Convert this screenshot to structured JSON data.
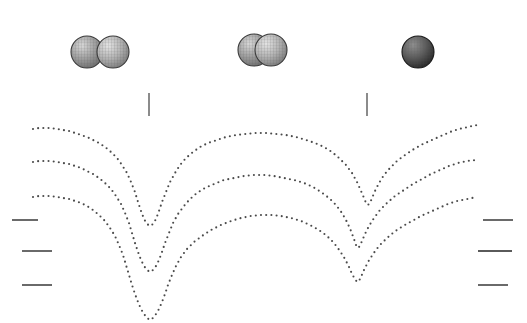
{
  "figure": {
    "title": "",
    "background_color": "#ffffff",
    "width": 527,
    "height": 323,
    "dot_color": "#4a4a4a",
    "tick_color": "#5a5a5a"
  },
  "sphere_groups": [
    {
      "name": "separated-pair",
      "label": "",
      "spheres": [
        {
          "cx": 87,
          "cy": 52,
          "r": 16,
          "fill": "#9a9a9a",
          "stroke": "#3a3a3a"
        },
        {
          "cx": 113,
          "cy": 52,
          "r": 16,
          "fill": "#b0b0b0",
          "stroke": "#3a3a3a"
        }
      ]
    },
    {
      "name": "overlapping-pair",
      "label": "",
      "spheres": [
        {
          "cx": 254,
          "cy": 50,
          "r": 16,
          "fill": "#909090",
          "stroke": "#3a3a3a"
        },
        {
          "cx": 271,
          "cy": 50,
          "r": 16,
          "fill": "#a8a8a8",
          "stroke": "#3a3a3a"
        }
      ]
    },
    {
      "name": "merged-single",
      "label": "",
      "spheres": [
        {
          "cx": 418,
          "cy": 52,
          "r": 16,
          "fill": "#5d5d5d",
          "stroke": "#1a1a1a"
        }
      ]
    }
  ],
  "vertical_ticks": [
    {
      "name": "vertical-tick-left",
      "x": 149,
      "y": 93,
      "height": 23
    },
    {
      "name": "vertical-tick-right",
      "x": 367,
      "y": 93,
      "height": 23
    }
  ],
  "axis_ticks_left": [
    {
      "name": "left-tick-1",
      "x": 12,
      "y": 220,
      "width": 26
    },
    {
      "name": "left-tick-2",
      "x": 22,
      "y": 251,
      "width": 30
    },
    {
      "name": "left-tick-3",
      "x": 22,
      "y": 285,
      "width": 30
    }
  ],
  "axis_ticks_right": [
    {
      "name": "right-tick-1",
      "x": 483,
      "y": 220,
      "width": 30
    },
    {
      "name": "right-tick-2",
      "x": 478,
      "y": 251,
      "width": 34
    },
    {
      "name": "right-tick-3",
      "x": 478,
      "y": 285,
      "width": 30
    }
  ],
  "chart_data": {
    "type": "line",
    "title": "",
    "subtitle": "",
    "xlabel": "",
    "ylabel": "",
    "xlim": [
      0,
      527
    ],
    "ylim": [
      323,
      0
    ],
    "grid": false,
    "legend": null,
    "line_style": "dotted",
    "annotations": [
      "separated spheres",
      "partially overlapping spheres",
      "fully merged sphere"
    ],
    "series": [
      {
        "name": "curve-top",
        "color": "#4a4a4a",
        "points": [
          [
            33,
            129
          ],
          [
            39,
            128
          ],
          [
            45,
            128
          ],
          [
            51,
            128
          ],
          [
            57,
            129
          ],
          [
            63,
            130
          ],
          [
            69,
            131
          ],
          [
            75,
            133
          ],
          [
            81,
            135
          ],
          [
            87,
            137
          ],
          [
            93,
            140
          ],
          [
            99,
            143
          ],
          [
            105,
            147
          ],
          [
            111,
            152
          ],
          [
            117,
            158
          ],
          [
            122,
            165
          ],
          [
            127,
            173
          ],
          [
            131,
            182
          ],
          [
            135,
            192
          ],
          [
            138,
            202
          ],
          [
            141,
            211
          ],
          [
            144,
            219
          ],
          [
            147,
            224
          ],
          [
            150,
            226
          ],
          [
            153,
            224
          ],
          [
            156,
            219
          ],
          [
            159,
            211
          ],
          [
            162,
            202
          ],
          [
            166,
            192
          ],
          [
            170,
            182
          ],
          [
            175,
            173
          ],
          [
            180,
            165
          ],
          [
            186,
            158
          ],
          [
            193,
            152
          ],
          [
            200,
            147
          ],
          [
            208,
            143
          ],
          [
            217,
            140
          ],
          [
            226,
            137
          ],
          [
            236,
            135
          ],
          [
            246,
            134
          ],
          [
            256,
            133
          ],
          [
            266,
            133
          ],
          [
            276,
            134
          ],
          [
            286,
            135
          ],
          [
            296,
            137
          ],
          [
            306,
            140
          ],
          [
            315,
            143
          ],
          [
            324,
            147
          ],
          [
            332,
            152
          ],
          [
            339,
            158
          ],
          [
            346,
            165
          ],
          [
            352,
            173
          ],
          [
            357,
            182
          ],
          [
            361,
            191
          ],
          [
            364,
            198
          ],
          [
            366,
            203
          ],
          [
            368,
            205
          ],
          [
            370,
            203
          ],
          [
            372,
            198
          ],
          [
            375,
            191
          ],
          [
            379,
            183
          ],
          [
            384,
            175
          ],
          [
            390,
            168
          ],
          [
            397,
            161
          ],
          [
            405,
            155
          ],
          [
            414,
            149
          ],
          [
            423,
            144
          ],
          [
            432,
            140
          ],
          [
            441,
            136
          ],
          [
            450,
            132
          ],
          [
            459,
            129
          ],
          [
            468,
            127
          ],
          [
            477,
            125
          ]
        ]
      },
      {
        "name": "curve-middle",
        "color": "#4a4a4a",
        "points": [
          [
            33,
            162
          ],
          [
            39,
            161
          ],
          [
            45,
            161
          ],
          [
            51,
            161
          ],
          [
            57,
            162
          ],
          [
            63,
            163
          ],
          [
            69,
            164
          ],
          [
            75,
            166
          ],
          [
            81,
            168
          ],
          [
            87,
            171
          ],
          [
            93,
            174
          ],
          [
            99,
            178
          ],
          [
            105,
            183
          ],
          [
            111,
            189
          ],
          [
            116,
            196
          ],
          [
            121,
            204
          ],
          [
            125,
            213
          ],
          [
            129,
            223
          ],
          [
            132,
            233
          ],
          [
            135,
            243
          ],
          [
            138,
            252
          ],
          [
            141,
            260
          ],
          [
            144,
            266
          ],
          [
            147,
            270
          ],
          [
            150,
            272
          ],
          [
            153,
            270
          ],
          [
            156,
            266
          ],
          [
            159,
            260
          ],
          [
            162,
            252
          ],
          [
            165,
            243
          ],
          [
            169,
            233
          ],
          [
            173,
            223
          ],
          [
            178,
            214
          ],
          [
            184,
            206
          ],
          [
            190,
            199
          ],
          [
            197,
            193
          ],
          [
            205,
            188
          ],
          [
            214,
            184
          ],
          [
            224,
            180
          ],
          [
            234,
            178
          ],
          [
            244,
            176
          ],
          [
            254,
            175
          ],
          [
            264,
            175
          ],
          [
            274,
            176
          ],
          [
            284,
            178
          ],
          [
            294,
            180
          ],
          [
            304,
            183
          ],
          [
            313,
            187
          ],
          [
            321,
            192
          ],
          [
            329,
            198
          ],
          [
            336,
            205
          ],
          [
            342,
            213
          ],
          [
            347,
            222
          ],
          [
            351,
            231
          ],
          [
            354,
            239
          ],
          [
            356,
            245
          ],
          [
            358,
            248
          ],
          [
            360,
            246
          ],
          [
            362,
            241
          ],
          [
            365,
            234
          ],
          [
            369,
            226
          ],
          [
            374,
            218
          ],
          [
            380,
            210
          ],
          [
            387,
            203
          ],
          [
            395,
            196
          ],
          [
            404,
            190
          ],
          [
            413,
            184
          ],
          [
            422,
            179
          ],
          [
            431,
            174
          ],
          [
            440,
            170
          ],
          [
            449,
            166
          ],
          [
            458,
            163
          ],
          [
            467,
            161
          ],
          [
            477,
            160
          ]
        ]
      },
      {
        "name": "curve-bottom",
        "color": "#4a4a4a",
        "points": [
          [
            33,
            197
          ],
          [
            39,
            196
          ],
          [
            45,
            196
          ],
          [
            51,
            196
          ],
          [
            57,
            197
          ],
          [
            63,
            198
          ],
          [
            69,
            199
          ],
          [
            75,
            201
          ],
          [
            81,
            203
          ],
          [
            87,
            206
          ],
          [
            93,
            210
          ],
          [
            99,
            215
          ],
          [
            105,
            221
          ],
          [
            110,
            228
          ],
          [
            115,
            236
          ],
          [
            119,
            245
          ],
          [
            123,
            255
          ],
          [
            126,
            265
          ],
          [
            129,
            275
          ],
          [
            132,
            285
          ],
          [
            135,
            294
          ],
          [
            138,
            302
          ],
          [
            141,
            309
          ],
          [
            144,
            314
          ],
          [
            147,
            318
          ],
          [
            150,
            320
          ],
          [
            153,
            318
          ],
          [
            156,
            314
          ],
          [
            159,
            309
          ],
          [
            162,
            302
          ],
          [
            165,
            294
          ],
          [
            168,
            285
          ],
          [
            172,
            275
          ],
          [
            176,
            266
          ],
          [
            181,
            257
          ],
          [
            187,
            249
          ],
          [
            194,
            242
          ],
          [
            202,
            236
          ],
          [
            211,
            230
          ],
          [
            221,
            225
          ],
          [
            231,
            221
          ],
          [
            241,
            218
          ],
          [
            251,
            216
          ],
          [
            261,
            215
          ],
          [
            271,
            215
          ],
          [
            281,
            216
          ],
          [
            291,
            218
          ],
          [
            301,
            221
          ],
          [
            310,
            225
          ],
          [
            319,
            230
          ],
          [
            327,
            236
          ],
          [
            334,
            243
          ],
          [
            340,
            251
          ],
          [
            345,
            259
          ],
          [
            349,
            267
          ],
          [
            352,
            274
          ],
          [
            355,
            279
          ],
          [
            357,
            282
          ],
          [
            359,
            281
          ],
          [
            361,
            277
          ],
          [
            364,
            270
          ],
          [
            368,
            262
          ],
          [
            373,
            254
          ],
          [
            379,
            246
          ],
          [
            386,
            239
          ],
          [
            394,
            232
          ],
          [
            403,
            226
          ],
          [
            412,
            221
          ],
          [
            421,
            216
          ],
          [
            430,
            212
          ],
          [
            439,
            208
          ],
          [
            448,
            204
          ],
          [
            457,
            201
          ],
          [
            467,
            199
          ],
          [
            477,
            197
          ]
        ]
      }
    ]
  }
}
